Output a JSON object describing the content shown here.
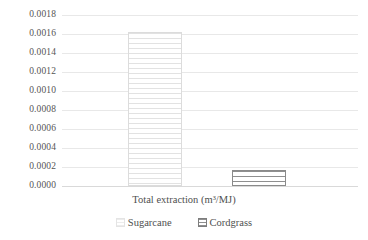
{
  "chart_data": {
    "type": "bar",
    "title": "",
    "subtitle": "",
    "xlabel": "Total extraction (m³/MJ)",
    "ylabel": "",
    "categories": [
      "Total extraction (m³/MJ)"
    ],
    "series": [
      {
        "name": "Sugarcane",
        "values": [
          0.00162
        ],
        "pattern": "horizontal-hatch-light",
        "color": "#e2e2e2"
      },
      {
        "name": "Cordgrass",
        "values": [
          0.00017
        ],
        "pattern": "horizontal-hatch-dark",
        "color": "#8f8f8f"
      }
    ],
    "ylim": [
      0.0,
      0.0018
    ],
    "ytick_step": 0.0002,
    "ytick_labels": [
      "0.0018",
      "0.0016",
      "0.0014",
      "0.0012",
      "0.0010",
      "0.0008",
      "0.0006",
      "0.0004",
      "0.0002",
      "0.0000"
    ],
    "ytick_values": [
      0.0018,
      0.0016,
      0.0014,
      0.0012,
      0.001,
      0.0008,
      0.0006,
      0.0004,
      0.0002,
      0.0
    ],
    "xtick_labels": [],
    "grid": "horizontal",
    "legend_position": "bottom",
    "legend": [
      {
        "label": "Sugarcane",
        "swatch": "hatch-light-swatch"
      },
      {
        "label": "Cordgrass",
        "swatch": "hatch-dark-swatch"
      }
    ],
    "background": "#ffffff",
    "gridline_color": "#e8e8e8",
    "text_color": "#555555"
  }
}
